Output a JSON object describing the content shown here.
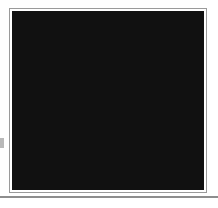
{
  "figure": {
    "frame": {
      "outline_color": "#9a9a9a",
      "keyline_color": "#111111",
      "background_color": "#ffffff"
    },
    "baseline_rule_color": "#8d8d8d",
    "edge_tick_color": "#b9b9b9"
  },
  "fabrics": [
    {
      "id": "crosshatch",
      "label": "dark diagonal cross-hatch",
      "tone": "dark",
      "color": "#1b1b1b"
    },
    {
      "id": "diagonal",
      "label": "white with dark diagonal stripes",
      "tone": "light",
      "color": "#ffffff"
    },
    {
      "id": "checker",
      "label": "small checkerboard",
      "tone": "medium",
      "color": "#1b1b1b"
    },
    {
      "id": "dotgrid",
      "label": "light grid with center dots",
      "tone": "light",
      "color": "#ffffff"
    },
    {
      "id": "plaid",
      "label": "dark window-pane plaid",
      "tone": "dark",
      "color": "#1b1b1b"
    },
    {
      "id": "speckle",
      "label": "light scattered speckle",
      "tone": "light",
      "color": "#ffffff"
    },
    {
      "id": "basketweave",
      "label": "black basketweave maze",
      "tone": "dark",
      "color": "#1b1b1b"
    }
  ],
  "grid": {
    "rows": 3,
    "columns": 3,
    "sashing_color": "#111111"
  },
  "blocks": [
    {
      "position": "top-left",
      "row": 1,
      "column": 1,
      "construction": "four-patch",
      "name": "Four-patch: cross-hatch and diagonal stripe",
      "patches": [
        {
          "cell": "top-left",
          "fabric": "crosshatch"
        },
        {
          "cell": "top-right",
          "fabric": "diagonal"
        },
        {
          "cell": "bottom-left",
          "fabric": "diagonal"
        },
        {
          "cell": "bottom-right",
          "fabric": "crosshatch"
        }
      ]
    },
    {
      "position": "top-center",
      "row": 1,
      "column": 2,
      "construction": "half-square-triangle",
      "name": "Half-square triangle: dot grid over checkerboard",
      "diagonal": "top-left-to-bottom-right",
      "triangles": [
        {
          "side": "upper-right",
          "fabric": "dotgrid"
        },
        {
          "side": "lower-left",
          "fabric": "checker"
        }
      ]
    },
    {
      "position": "top-right",
      "row": 1,
      "column": 3,
      "construction": "four-patch",
      "name": "Four-patch: plaid and diagonal stripe",
      "patches": [
        {
          "cell": "top-left",
          "fabric": "plaid"
        },
        {
          "cell": "top-right",
          "fabric": "diagonal"
        },
        {
          "cell": "bottom-left",
          "fabric": "diagonal"
        },
        {
          "cell": "bottom-right",
          "fabric": "plaid"
        }
      ]
    },
    {
      "position": "middle-left",
      "row": 2,
      "column": 1,
      "construction": "half-square-triangle",
      "name": "Half-square triangle: checkerboard over dot grid",
      "diagonal": "top-left-to-bottom-right",
      "triangles": [
        {
          "side": "upper-right",
          "fabric": "checker"
        },
        {
          "side": "lower-left",
          "fabric": "dotgrid"
        }
      ]
    },
    {
      "position": "center",
      "row": 2,
      "column": 2,
      "construction": "four-patch",
      "name": "Center four-patch: cross-hatch and speckle",
      "patches": [
        {
          "cell": "top-left",
          "fabric": "crosshatch"
        },
        {
          "cell": "top-right",
          "fabric": "speckle"
        },
        {
          "cell": "bottom-left",
          "fabric": "speckle"
        },
        {
          "cell": "bottom-right",
          "fabric": "crosshatch"
        }
      ]
    },
    {
      "position": "middle-right",
      "row": 2,
      "column": 3,
      "construction": "half-square-triangle",
      "name": "Half-square triangle: dot grid over checkerboard",
      "diagonal": "top-right-to-bottom-left",
      "triangles": [
        {
          "side": "upper-right",
          "fabric": "dotgrid"
        },
        {
          "side": "lower-left",
          "fabric": "checker"
        }
      ]
    },
    {
      "position": "bottom-left",
      "row": 3,
      "column": 1,
      "construction": "four-patch",
      "name": "Four-patch: basketweave and diagonal stripe",
      "patches": [
        {
          "cell": "top-left",
          "fabric": "basketweave"
        },
        {
          "cell": "top-right",
          "fabric": "diagonal"
        },
        {
          "cell": "bottom-left",
          "fabric": "diagonal"
        },
        {
          "cell": "bottom-right",
          "fabric": "basketweave"
        }
      ]
    },
    {
      "position": "bottom-center",
      "row": 3,
      "column": 2,
      "construction": "half-square-triangle",
      "name": "Half-square triangle: checkerboard over dot grid",
      "diagonal": "top-left-to-bottom-right",
      "triangles": [
        {
          "side": "upper-right",
          "fabric": "checker"
        },
        {
          "side": "lower-left",
          "fabric": "dotgrid"
        }
      ]
    },
    {
      "position": "bottom-right",
      "row": 3,
      "column": 3,
      "construction": "four-patch",
      "name": "Four-patch: cross-hatch and diagonal stripe",
      "patches": [
        {
          "cell": "top-left",
          "fabric": "crosshatch"
        },
        {
          "cell": "top-right",
          "fabric": "diagonal"
        },
        {
          "cell": "bottom-left",
          "fabric": "diagonal"
        },
        {
          "cell": "bottom-right",
          "fabric": "crosshatch"
        }
      ]
    }
  ]
}
